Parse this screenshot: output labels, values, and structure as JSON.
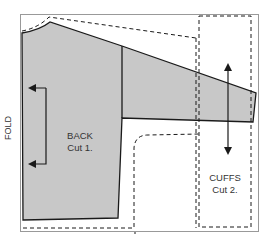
{
  "diagram": {
    "fold_label": "FOLD",
    "pieces": [
      {
        "name": "BACK",
        "instruction": "Cut 1."
      },
      {
        "name": "CUFFS",
        "instruction": "Cut 2."
      }
    ],
    "colors": {
      "piece_fill": "#c8c8c8",
      "outline": "#1a1a1a",
      "border": "#999999"
    }
  }
}
